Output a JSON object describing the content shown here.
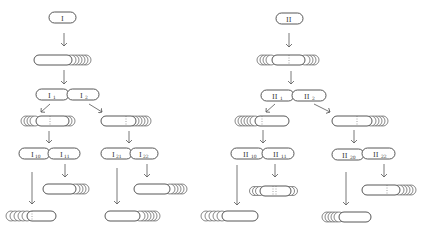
{
  "diagram": {
    "type": "cell-lineage-tree",
    "trees": [
      {
        "id": "tree-I",
        "root": {
          "label": "I"
        },
        "generation_1": {
          "labels": [
            "I",
            "1",
            "I",
            "2"
          ]
        },
        "branches": [
          {
            "parent": "I1",
            "children": [
              {
                "label": "I",
                "sub": "10"
              },
              {
                "label": "I",
                "sub": "11"
              }
            ]
          },
          {
            "parent": "I2",
            "children": [
              {
                "label": "I",
                "sub": "21"
              },
              {
                "label": "I",
                "sub": "22"
              }
            ]
          }
        ]
      },
      {
        "id": "tree-II",
        "root": {
          "label": "II"
        },
        "generation_1": {
          "labels": [
            "II",
            "1",
            "II",
            "2"
          ]
        },
        "branches": [
          {
            "parent": "II1",
            "children": [
              {
                "label": "II",
                "sub": "10"
              },
              {
                "label": "II",
                "sub": "11"
              }
            ]
          },
          {
            "parent": "II2",
            "children": [
              {
                "label": "II",
                "sub": "20"
              },
              {
                "label": "II",
                "sub": "22"
              }
            ]
          }
        ]
      }
    ],
    "colors": {
      "line": "#444444",
      "background": "#ffffff"
    }
  },
  "labels": {
    "I_root": "I",
    "I_1": "I",
    "I_1_sub": "1",
    "I_2": "I",
    "I_2_sub": "2",
    "I_10": "I",
    "I_10_sub": "10",
    "I_11": "I",
    "I_11_sub": "11",
    "I_21": "I",
    "I_21_sub": "21",
    "I_22": "I",
    "I_22_sub": "22",
    "II_root": "II",
    "II_1": "II",
    "II_1_sub": "1",
    "II_2": "II",
    "II_2_sub": "2",
    "II_10": "II",
    "II_10_sub": "10",
    "II_11": "II",
    "II_11_sub": "11",
    "II_20": "II",
    "II_20_sub": "20",
    "II_22": "II",
    "II_22_sub": "22"
  }
}
